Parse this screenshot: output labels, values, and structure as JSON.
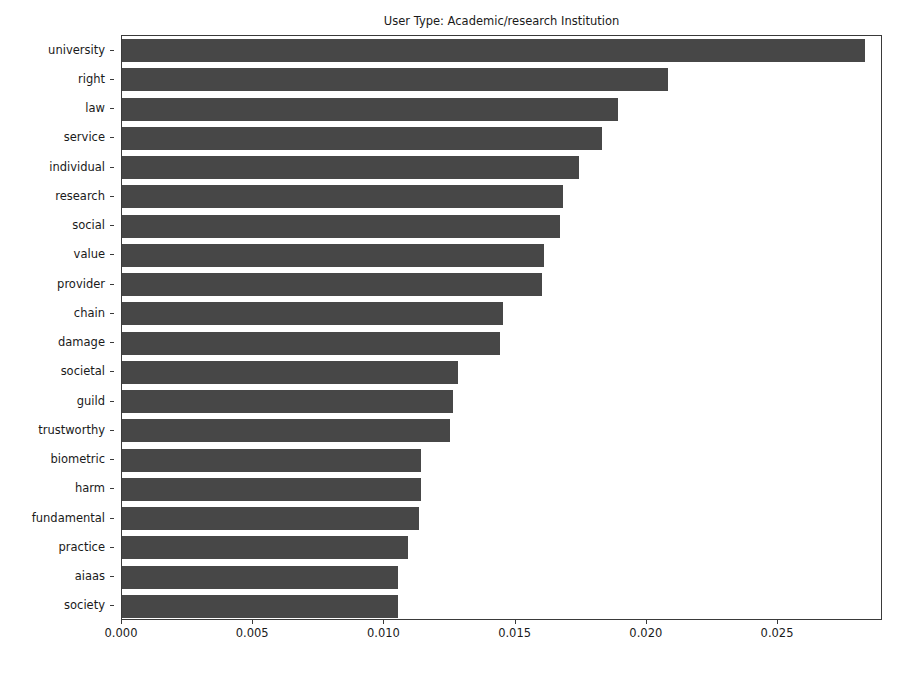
{
  "chart_data": {
    "type": "bar",
    "orientation": "horizontal",
    "title": "User Type: Academic/research Institution",
    "xlabel": "",
    "ylabel": "",
    "categories": [
      "university",
      "right",
      "law",
      "service",
      "individual",
      "research",
      "social",
      "value",
      "provider",
      "chain",
      "damage",
      "societal",
      "guild",
      "trustworthy",
      "biometric",
      "harm",
      "fundamental",
      "practice",
      "aiaas",
      "society"
    ],
    "values": [
      0.0283,
      0.0208,
      0.0189,
      0.0183,
      0.0174,
      0.0168,
      0.0167,
      0.0161,
      0.016,
      0.0145,
      0.0144,
      0.0128,
      0.0126,
      0.0125,
      0.0114,
      0.0114,
      0.0113,
      0.0109,
      0.0105,
      0.0105
    ],
    "xlim": [
      0.0,
      0.029
    ],
    "ylim": [
      -0.5,
      19.5
    ],
    "xticks": [
      0.0,
      0.005,
      0.01,
      0.015,
      0.02,
      0.025
    ],
    "xtick_labels": [
      "0.000",
      "0.005",
      "0.010",
      "0.015",
      "0.020",
      "0.025"
    ],
    "grid": false,
    "legend": null,
    "bar_color": "#474747",
    "axes_color": "#3a3a3a",
    "text_color": "#1a1a1a",
    "background": "#ffffff"
  }
}
